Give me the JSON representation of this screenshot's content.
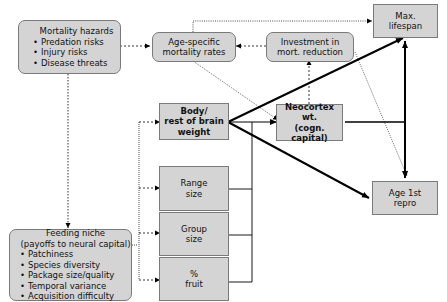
{
  "nodes": {
    "mortality_hazards": {
      "title": "Mortality hazards",
      "items": [
        "Predation risks",
        "Injury risks",
        "Disease threats"
      ]
    },
    "age_specific_mortality": {
      "title": "Age-specific\nmortality rates"
    },
    "investment_mort_reduction": {
      "title": "Investment in\nmort. reduction"
    },
    "max_lifespan": {
      "title": "Max.\nlifespan"
    },
    "body_brain_weight": {
      "title": "Body/\nrest of brain\nweight"
    },
    "neocortex_wt": {
      "title": "Neocortex wt.\n(cogn. capital)"
    },
    "range_size": {
      "title": "Range\nsize"
    },
    "group_size": {
      "title": "Group\nsize"
    },
    "pct_fruit": {
      "title": "%\nfruit"
    },
    "age_first_repro": {
      "title": "Age 1st\nrepro"
    },
    "feeding_niche": {
      "title": "Feeding niche\n(payoffs to neural capital)",
      "items": [
        "Patchiness",
        "Species diversity",
        "Package size/quality",
        "Temporal variance",
        "Acquisition difficulty"
      ]
    }
  },
  "colors": {
    "box_fill": "#d4d4d4",
    "box_border": "#7a7a7a",
    "line": "#000000"
  }
}
